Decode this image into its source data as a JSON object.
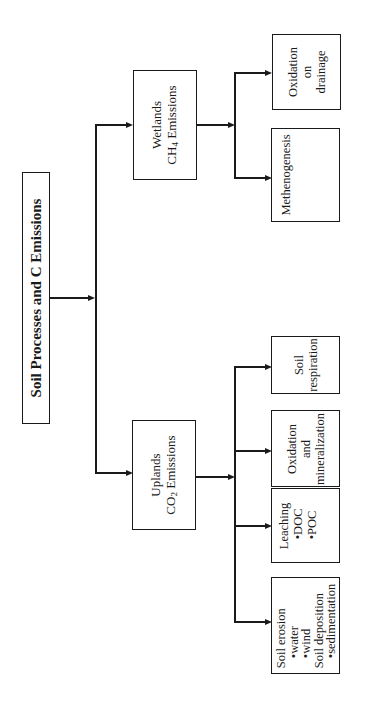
{
  "diagram": {
    "root": {
      "label": "Soil Processes and C Emissions"
    },
    "branches": [
      {
        "id": "wetlands",
        "label_line1": "Wetlands",
        "label_line2_prefix": "CH",
        "label_line2_sub": "4",
        "label_line2_suffix": " Emissions",
        "children": [
          {
            "id": "methanogenesis",
            "lines": [
              "Methenogenesis"
            ]
          },
          {
            "id": "oxidation-on-drainage",
            "lines": [
              "Oxidation",
              "on",
              "drainage"
            ]
          }
        ]
      },
      {
        "id": "uplands",
        "label_line1": "Uplands",
        "label_line2_prefix": "CO",
        "label_line2_sub": "2",
        "label_line2_suffix": " Emissions",
        "children": [
          {
            "id": "soil-erosion",
            "lines": [
              "Soil erosion",
              "•water",
              "•wind",
              "Soil deposition",
              "•sedimentation"
            ]
          },
          {
            "id": "leaching",
            "lines": [
              "Leaching",
              "•DOC",
              "•POC"
            ]
          },
          {
            "id": "oxidation-mineralization",
            "lines": [
              "Oxidation",
              "and",
              "mineralization"
            ]
          },
          {
            "id": "soil-respiration",
            "lines": [
              "Soil",
              "respiration"
            ]
          }
        ]
      }
    ]
  }
}
